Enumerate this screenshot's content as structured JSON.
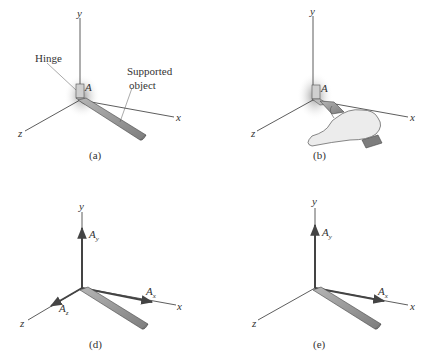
{
  "panels": [
    {
      "id": "a",
      "caption": "(a)",
      "axes": {
        "x": "x",
        "y": "y",
        "z": "z"
      },
      "point_label": "A",
      "callouts": {
        "hinge": "Hinge",
        "object_line1": "Supported",
        "object_line2": "object"
      }
    },
    {
      "id": "b",
      "caption": "(b)",
      "axes": {
        "x": "x",
        "y": "y",
        "z": "z"
      },
      "point_label": "A"
    },
    {
      "id": "d",
      "caption": "(d)",
      "axes": {
        "x": "x",
        "y": "y",
        "z": "z"
      },
      "forces": {
        "Ay": {
          "base": "A",
          "sub": "y"
        },
        "Ax": {
          "base": "A",
          "sub": "x"
        },
        "Az": {
          "base": "A",
          "sub": "z"
        }
      }
    },
    {
      "id": "e",
      "caption": "(e)",
      "axes": {
        "x": "x",
        "y": "y",
        "z": "z"
      },
      "forces": {
        "Ay": {
          "base": "A",
          "sub": "y"
        },
        "Ax": {
          "base": "A",
          "sub": "x"
        }
      }
    }
  ],
  "colors": {
    "axis": "#333333",
    "bar_fill": "#8a8a8a",
    "bar_top": "#a8a8a8",
    "shadow": "#9a9a9a",
    "hand": "#e8e8e8"
  }
}
